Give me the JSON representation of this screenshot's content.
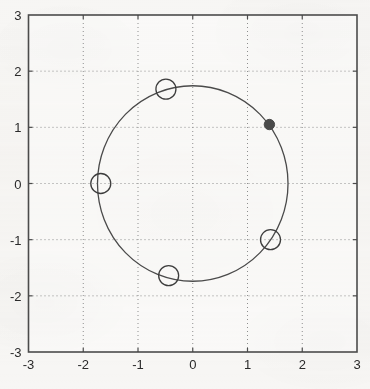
{
  "chart_data": {
    "type": "scatter",
    "title": "",
    "subtitle": "",
    "xlabel": "",
    "ylabel": "",
    "xlim": [
      -3,
      3
    ],
    "ylim": [
      -3,
      3
    ],
    "xticks": [
      "-3",
      "-2",
      "-1",
      "0",
      "1",
      "2",
      "3"
    ],
    "yticks": [
      "3",
      "2",
      "1",
      "0",
      "-1",
      "-2",
      "-3"
    ],
    "xtick_values": [
      -3,
      -2,
      -1,
      0,
      1,
      2,
      3
    ],
    "ytick_values": [
      3,
      2,
      1,
      0,
      -1,
      -2,
      -3
    ],
    "grid": true,
    "grid_style": "dotted",
    "legend": null,
    "annotations": [],
    "reference_curve": {
      "name": "circle",
      "center": [
        0,
        0
      ],
      "radius": 1.74,
      "style": "solid",
      "color": "#4a4a4a"
    },
    "series": [
      {
        "name": "open-circle-markers",
        "marker": "o",
        "filled": false,
        "color": "#3d3d3d",
        "points": [
          {
            "x": -0.49,
            "y": 1.68
          },
          {
            "x": -1.68,
            "y": 0.0
          },
          {
            "x": -0.44,
            "y": -1.64
          },
          {
            "x": 1.42,
            "y": -1.0
          }
        ]
      },
      {
        "name": "filled-dot-marker",
        "marker": "o",
        "filled": true,
        "color": "#4a4a4a",
        "points": [
          {
            "x": 1.4,
            "y": 1.05
          }
        ]
      }
    ]
  },
  "figure": {
    "background_color": "#f7f6f4",
    "axis_color": "#4b4b4b",
    "grid_color": "#8e8e8e",
    "text_color": "#2a2a2a"
  }
}
